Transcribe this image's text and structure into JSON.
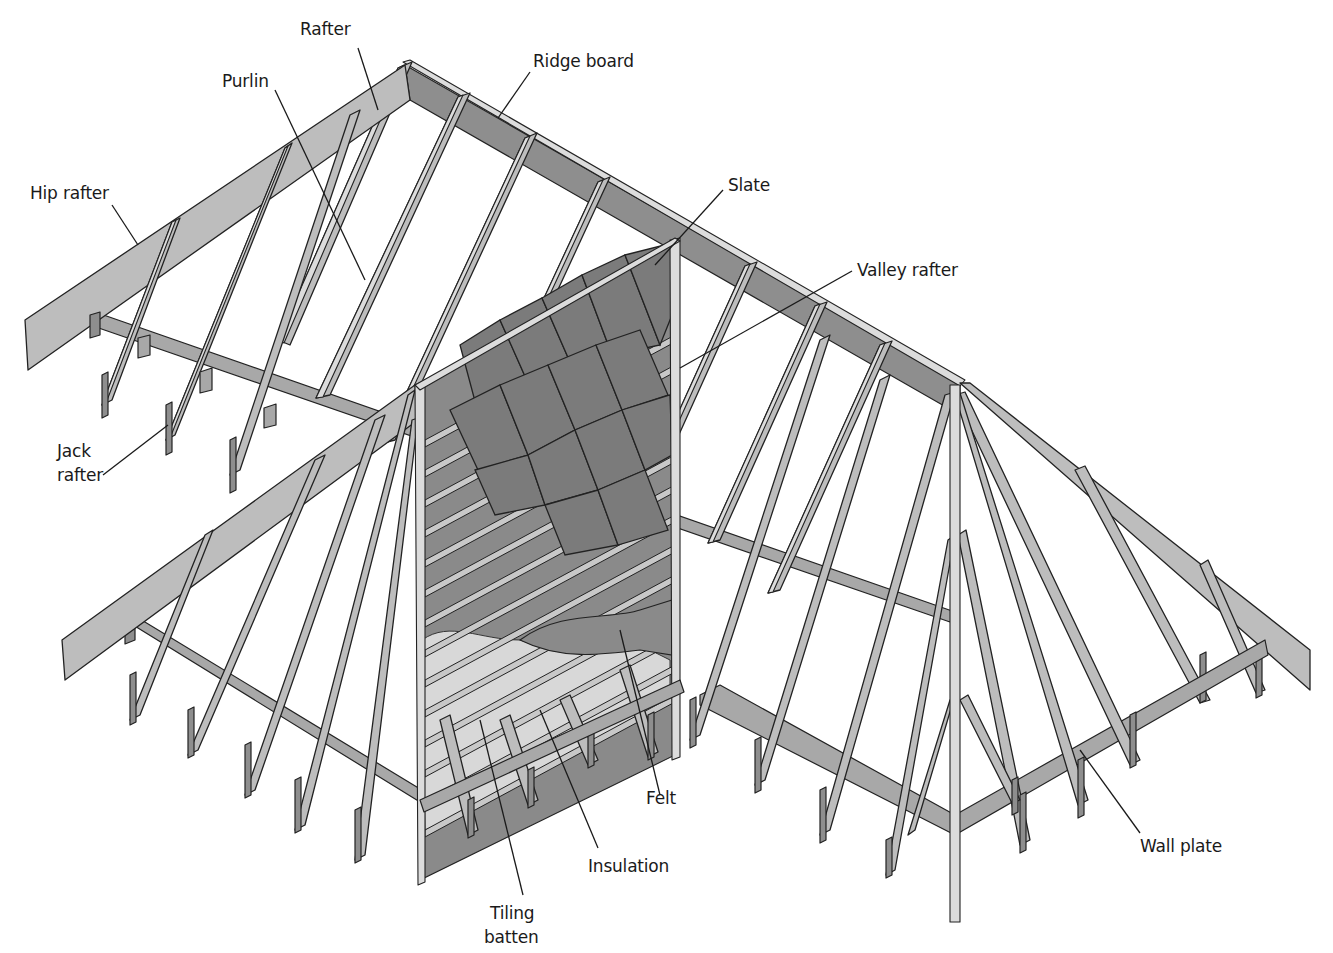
{
  "diagram": {
    "title_fragment": "",
    "colors": {
      "background": "#ffffff",
      "timber_face": "#bdbdbd",
      "timber_edge": "#dcdcdc",
      "timber_shadow": "#8e8e8e",
      "slate": "#7b7b7b",
      "insulation": "#d8d8d8",
      "leader_line": "#1a1a1a"
    },
    "labels": [
      {
        "id": "rafter",
        "text": "Rafter",
        "x": 300,
        "y": 18
      },
      {
        "id": "ridge-board",
        "text": "Ridge board",
        "x": 533,
        "y": 50
      },
      {
        "id": "purlin",
        "text": "Purlin",
        "x": 222,
        "y": 70
      },
      {
        "id": "hip-rafter",
        "text": "Hip rafter",
        "x": 30,
        "y": 182
      },
      {
        "id": "slate",
        "text": "Slate",
        "x": 728,
        "y": 174
      },
      {
        "id": "valley-rafter",
        "text": "Valley rafter",
        "x": 857,
        "y": 259
      },
      {
        "id": "jack-rafter-line1",
        "text": "Jack",
        "x": 57,
        "y": 440
      },
      {
        "id": "jack-rafter-line2",
        "text": "rafter",
        "x": 57,
        "y": 464
      },
      {
        "id": "felt",
        "text": "Felt",
        "x": 646,
        "y": 787
      },
      {
        "id": "insulation",
        "text": "Insulation",
        "x": 588,
        "y": 855
      },
      {
        "id": "wall-plate",
        "text": "Wall plate",
        "x": 1140,
        "y": 835
      },
      {
        "id": "tiling-batten-line1",
        "text": "Tiling",
        "x": 490,
        "y": 902
      },
      {
        "id": "tiling-batten-line2",
        "text": "batten",
        "x": 484,
        "y": 926
      }
    ],
    "components": [
      "Rafter",
      "Ridge board",
      "Purlin",
      "Hip rafter",
      "Slate",
      "Valley rafter",
      "Jack rafter",
      "Felt",
      "Insulation",
      "Wall plate",
      "Tiling batten"
    ]
  }
}
